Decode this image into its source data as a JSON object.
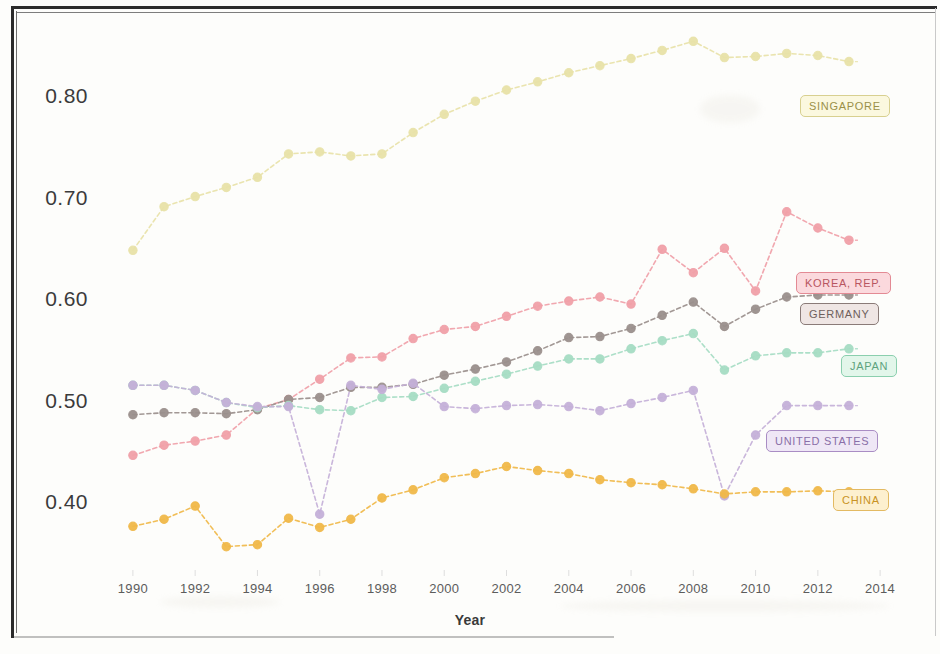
{
  "chart_data": {
    "type": "line",
    "title": "",
    "xlabel": "Year",
    "ylabel": "",
    "xlim": [
      1989.2,
      2014.8
    ],
    "ylim": [
      0.335,
      0.875
    ],
    "grid": false,
    "legend_position": "right-inline-labels",
    "x_ticks": [
      1990,
      1992,
      1994,
      1996,
      1998,
      2000,
      2002,
      2004,
      2006,
      2008,
      2010,
      2012,
      2014
    ],
    "y_ticks": [
      0.4,
      0.5,
      0.6,
      0.7,
      0.8
    ],
    "y_tick_labels": [
      "0.40",
      "0.50",
      "0.60",
      "0.70",
      "0.80"
    ],
    "x": [
      1990,
      1991,
      1992,
      1993,
      1994,
      1995,
      1996,
      1997,
      1998,
      1999,
      2000,
      2001,
      2002,
      2003,
      2004,
      2005,
      2006,
      2007,
      2008,
      2009,
      2010,
      2011,
      2012,
      2013
    ],
    "series": [
      {
        "name": "SINGAPORE",
        "color": "#e8e2a8",
        "label_text_color": "#9a9048",
        "label_bg": "#fbf8df",
        "label_border": "#d8d090",
        "values": [
          0.65,
          0.693,
          0.703,
          0.712,
          0.722,
          0.745,
          0.747,
          0.743,
          0.745,
          0.766,
          0.784,
          0.797,
          0.808,
          0.816,
          0.825,
          0.832,
          0.839,
          0.847,
          0.856,
          0.84,
          0.841,
          0.844,
          0.842,
          0.836
        ]
      },
      {
        "name": "KOREA, REP.",
        "color": "#f0a0a8",
        "label_text_color": "#b85560",
        "label_bg": "#fbd9dd",
        "label_border": "#e38a94",
        "values": [
          0.448,
          0.458,
          0.462,
          0.468,
          0.494,
          0.503,
          0.523,
          0.544,
          0.545,
          0.563,
          0.572,
          0.575,
          0.585,
          0.595,
          0.6,
          0.604,
          0.597,
          0.651,
          0.628,
          0.652,
          0.61,
          0.688,
          0.672,
          0.66
        ]
      },
      {
        "name": "GERMANY",
        "color": "#9a8f8c",
        "label_text_color": "#6e5f5c",
        "label_bg": "#efe6e4",
        "label_border": "#8a7b78",
        "values": [
          0.488,
          0.49,
          0.49,
          0.489,
          0.493,
          0.503,
          0.505,
          0.515,
          0.515,
          0.518,
          0.527,
          0.533,
          0.54,
          0.551,
          0.564,
          0.565,
          0.573,
          0.586,
          0.599,
          0.575,
          0.592,
          0.604,
          0.606,
          0.606
        ]
      },
      {
        "name": "JAPAN",
        "color": "#a5dcc3",
        "label_text_color": "#5ea37e",
        "label_bg": "#e2f6ea",
        "label_border": "#8bcfae",
        "values": [
          0.517,
          0.517,
          0.512,
          0.5,
          0.495,
          0.497,
          0.493,
          0.492,
          0.505,
          0.506,
          0.514,
          0.521,
          0.528,
          0.536,
          0.543,
          0.543,
          0.553,
          0.561,
          0.568,
          0.532,
          0.546,
          0.549,
          0.549,
          0.553
        ]
      },
      {
        "name": "UNITED STATES",
        "color": "#c4b0d8",
        "label_text_color": "#8a6fa8",
        "label_bg": "#efe7f6",
        "label_border": "#a98dc4",
        "values": [
          0.517,
          0.517,
          0.512,
          0.5,
          0.496,
          0.496,
          0.39,
          0.517,
          0.513,
          0.519,
          0.496,
          0.494,
          0.497,
          0.498,
          0.496,
          0.492,
          0.499,
          0.505,
          0.512,
          0.408,
          0.468,
          0.497,
          0.497,
          0.497
        ]
      },
      {
        "name": "CHINA",
        "color": "#f0b849",
        "label_text_color": "#c99324",
        "label_bg": "#fdf0cf",
        "label_border": "#e3ba62",
        "values": [
          0.378,
          0.385,
          0.398,
          0.358,
          0.36,
          0.386,
          0.377,
          0.385,
          0.406,
          0.414,
          0.426,
          0.43,
          0.437,
          0.433,
          0.43,
          0.424,
          0.421,
          0.419,
          0.415,
          0.41,
          0.412,
          0.412,
          0.413,
          0.412
        ]
      }
    ]
  },
  "axis": {
    "x_title": "Year"
  }
}
